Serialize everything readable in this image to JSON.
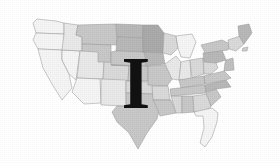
{
  "figure": {
    "kind": "map-with-letter-overlay",
    "background_color": "#ffffff",
    "width": 279,
    "height": 164
  },
  "map": {
    "name": "united-states-map",
    "subject": "Contiguous United States",
    "style": "halftone grayscale, state outlines, choropleth shading",
    "outline_color": "#8a8a8a",
    "shade_palette": {
      "very_light": "#f2f2f2",
      "light": "#e4e4e4",
      "medium_light": "#d2d2d2",
      "medium": "#bdbdbd",
      "medium_dark": "#ababab",
      "dark": "#9a9a9a"
    },
    "regions": [
      {
        "id": "pacific-northwest",
        "label": "WA / OR",
        "shade": "very_light"
      },
      {
        "id": "california",
        "label": "CA",
        "shade": "very_light"
      },
      {
        "id": "nevada",
        "label": "NV",
        "shade": "very_light"
      },
      {
        "id": "idaho",
        "label": "ID",
        "shade": "light"
      },
      {
        "id": "montana",
        "label": "MT",
        "shade": "medium"
      },
      {
        "id": "wyoming",
        "label": "WY",
        "shade": "medium"
      },
      {
        "id": "utah",
        "label": "UT",
        "shade": "light"
      },
      {
        "id": "arizona",
        "label": "AZ",
        "shade": "very_light"
      },
      {
        "id": "colorado",
        "label": "CO",
        "shade": "medium_light"
      },
      {
        "id": "new-mexico",
        "label": "NM",
        "shade": "light"
      },
      {
        "id": "north-dakota",
        "label": "ND",
        "shade": "medium_dark"
      },
      {
        "id": "south-dakota",
        "label": "SD",
        "shade": "medium_dark"
      },
      {
        "id": "nebraska",
        "label": "NE",
        "shade": "medium"
      },
      {
        "id": "kansas",
        "label": "KS",
        "shade": "medium"
      },
      {
        "id": "oklahoma",
        "label": "OK",
        "shade": "medium_light"
      },
      {
        "id": "texas",
        "label": "TX",
        "shade": "medium"
      },
      {
        "id": "minnesota",
        "label": "MN",
        "shade": "dark"
      },
      {
        "id": "iowa",
        "label": "IA",
        "shade": "medium_dark"
      },
      {
        "id": "missouri",
        "label": "MO",
        "shade": "medium"
      },
      {
        "id": "arkansas",
        "label": "AR",
        "shade": "medium_light"
      },
      {
        "id": "louisiana",
        "label": "LA",
        "shade": "medium"
      },
      {
        "id": "wisconsin",
        "label": "WI",
        "shade": "medium_light"
      },
      {
        "id": "illinois",
        "label": "IL",
        "shade": "light"
      },
      {
        "id": "michigan",
        "label": "MI",
        "shade": "very_light"
      },
      {
        "id": "indiana",
        "label": "IN",
        "shade": "light"
      },
      {
        "id": "ohio",
        "label": "OH",
        "shade": "medium_light"
      },
      {
        "id": "kentucky",
        "label": "KY",
        "shade": "medium"
      },
      {
        "id": "tennessee",
        "label": "TN",
        "shade": "medium"
      },
      {
        "id": "mississippi",
        "label": "MS",
        "shade": "medium_light"
      },
      {
        "id": "alabama",
        "label": "AL",
        "shade": "medium"
      },
      {
        "id": "georgia",
        "label": "GA",
        "shade": "medium_light"
      },
      {
        "id": "florida",
        "label": "FL",
        "shade": "very_light"
      },
      {
        "id": "south-carolina",
        "label": "SC",
        "shade": "medium"
      },
      {
        "id": "north-carolina",
        "label": "NC",
        "shade": "medium_dark"
      },
      {
        "id": "virginia",
        "label": "VA",
        "shade": "medium"
      },
      {
        "id": "west-virginia",
        "label": "WV",
        "shade": "medium_light"
      },
      {
        "id": "pennsylvania",
        "label": "PA",
        "shade": "medium_dark"
      },
      {
        "id": "new-york",
        "label": "NY",
        "shade": "medium"
      },
      {
        "id": "new-england",
        "label": "New England",
        "shade": "medium_light"
      },
      {
        "id": "maine",
        "label": "ME",
        "shade": "medium_dark"
      }
    ]
  },
  "overlay": {
    "letter": "I",
    "color": "#111111",
    "typeface_style": "bold serif",
    "position_hint": "center of map, over the central plains"
  }
}
